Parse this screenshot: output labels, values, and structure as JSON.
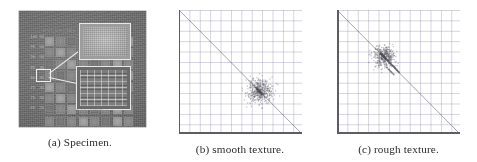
{
  "figure": {
    "layout": "three-panel-row",
    "panels": [
      {
        "id": "a",
        "caption": "(a) Specimen.",
        "type": "photograph",
        "subject": "grayscale photograph of a metal specimen plate bearing an 8x8 matrix of machined pads, with two white rectangular callout insets magnifying a smooth-textured pad and a rough-textured pad",
        "plate_color": "#6d6d6d",
        "inset_border_color": "#e8e8e8",
        "pad_rows": 8,
        "pad_cols": 8,
        "engraved_labels": {
          "header": "W/WC SPECIMEN",
          "row_values": [
            "105",
            "95",
            "90",
            "85",
            "80",
            "75",
            "70",
            "65"
          ],
          "row_values_secondary": [
            "60",
            "55",
            "50",
            "45",
            "40",
            "35",
            "30",
            "25"
          ],
          "footer_line_1": "Feature x Range (0-4.0 / 0-88.00 s)",
          "footer_line_2": "4  8  12  16  20  24  28  32  (kHz)"
        }
      },
      {
        "id": "b",
        "caption": "(b) smooth texture.",
        "type": "scatter"
      },
      {
        "id": "c",
        "caption": "(c) rough texture.",
        "type": "scatter"
      }
    ]
  },
  "chart_data": [
    {
      "id": "b",
      "type": "scatter",
      "title": "(b) smooth texture.",
      "xlabel": "",
      "ylabel": "",
      "xlim": [
        0,
        1
      ],
      "ylim": [
        0,
        1
      ],
      "grid": true,
      "grid_spacing": 0.0847,
      "legend": "none",
      "annotations": [
        {
          "kind": "line",
          "name": "anti-diagonal-constraint-line",
          "x": [
            0,
            1
          ],
          "y": [
            1,
            0
          ],
          "color": "#5a5a64"
        }
      ],
      "cluster": {
        "center_x": 0.655,
        "center_y": 0.344,
        "spread_x": 0.052,
        "spread_y": 0.046,
        "n_points": 420,
        "description": "single tight compact blob straddling the anti-diagonal"
      },
      "points_x": [
        0.655,
        0.642,
        0.668,
        0.651,
        0.661,
        0.636,
        0.672,
        0.647,
        0.659,
        0.664,
        0.631,
        0.678,
        0.649,
        0.657,
        0.666,
        0.644,
        0.653,
        0.67,
        0.639,
        0.662,
        0.656,
        0.648,
        0.674,
        0.633,
        0.66,
        0.652,
        0.667,
        0.641,
        0.658,
        0.663,
        0.646,
        0.671,
        0.637,
        0.654,
        0.665,
        0.65,
        0.676,
        0.643,
        0.659,
        0.655,
        0.669,
        0.634,
        0.661,
        0.647,
        0.673,
        0.64,
        0.656,
        0.664,
        0.645,
        0.657,
        0.68,
        0.628,
        0.662,
        0.651,
        0.668,
        0.638,
        0.653,
        0.675,
        0.644,
        0.66,
        0.649,
        0.666,
        0.635,
        0.658,
        0.67,
        0.642,
        0.654,
        0.663,
        0.647,
        0.659,
        0.684,
        0.624,
        0.665,
        0.65,
        0.671,
        0.64,
        0.656,
        0.677,
        0.646,
        0.661
      ],
      "points_y": [
        0.344,
        0.357,
        0.331,
        0.349,
        0.338,
        0.364,
        0.327,
        0.353,
        0.341,
        0.335,
        0.369,
        0.321,
        0.351,
        0.343,
        0.333,
        0.356,
        0.346,
        0.329,
        0.361,
        0.337,
        0.343,
        0.352,
        0.325,
        0.366,
        0.339,
        0.348,
        0.332,
        0.359,
        0.341,
        0.336,
        0.354,
        0.328,
        0.363,
        0.345,
        0.334,
        0.35,
        0.323,
        0.357,
        0.34,
        0.344,
        0.33,
        0.365,
        0.338,
        0.353,
        0.326,
        0.36,
        0.342,
        0.335,
        0.355,
        0.341,
        0.319,
        0.372,
        0.337,
        0.348,
        0.331,
        0.362,
        0.346,
        0.324,
        0.356,
        0.339,
        0.35,
        0.333,
        0.365,
        0.341,
        0.329,
        0.358,
        0.345,
        0.336,
        0.352,
        0.34,
        0.315,
        0.376,
        0.334,
        0.349,
        0.328,
        0.359,
        0.343,
        0.322,
        0.353,
        0.338
      ]
    },
    {
      "id": "c",
      "type": "scatter",
      "title": "(c) rough texture.",
      "xlabel": "",
      "ylabel": "",
      "xlim": [
        0,
        1
      ],
      "ylim": [
        0,
        1
      ],
      "grid": true,
      "grid_spacing": 0.0847,
      "legend": "none",
      "annotations": [
        {
          "kind": "line",
          "name": "anti-diagonal-constraint-line",
          "x": [
            0,
            1
          ],
          "y": [
            1,
            0
          ],
          "color": "#5a5a64"
        }
      ],
      "cluster": {
        "center_x": 0.378,
        "center_y": 0.627,
        "spread_x": 0.044,
        "spread_y": 0.042,
        "n_points": 380,
        "description": "dense dark core high on the anti-diagonal plus a diffuse scattered tail of outliers trailing down and to the right"
      },
      "points_x": [
        0.378,
        0.366,
        0.389,
        0.372,
        0.383,
        0.36,
        0.394,
        0.369,
        0.381,
        0.386,
        0.356,
        0.399,
        0.374,
        0.379,
        0.391,
        0.364,
        0.376,
        0.393,
        0.362,
        0.385,
        0.377,
        0.37,
        0.396,
        0.358,
        0.384,
        0.373,
        0.39,
        0.365,
        0.38,
        0.387,
        0.368,
        0.395,
        0.359,
        0.375,
        0.388,
        0.371,
        0.398,
        0.363,
        0.382,
        0.378,
        0.392,
        0.357,
        0.386,
        0.369,
        0.397,
        0.361,
        0.379,
        0.388,
        0.367,
        0.381,
        0.402,
        0.352,
        0.387,
        0.373,
        0.393,
        0.36,
        0.376,
        0.4,
        0.366,
        0.384,
        0.438,
        0.466,
        0.421,
        0.489,
        0.452,
        0.409,
        0.503,
        0.444,
        0.472,
        0.418,
        0.497,
        0.431,
        0.459,
        0.486,
        0.413,
        0.477,
        0.425,
        0.462,
        0.441,
        0.505,
        0.448,
        0.416,
        0.481,
        0.434,
        0.468,
        0.492,
        0.427,
        0.455,
        0.474,
        0.411,
        0.404,
        0.429,
        0.447,
        0.418,
        0.462,
        0.436,
        0.408,
        0.455,
        0.424,
        0.441
      ],
      "points_y": [
        0.627,
        0.64,
        0.615,
        0.633,
        0.621,
        0.646,
        0.609,
        0.637,
        0.624,
        0.618,
        0.65,
        0.604,
        0.631,
        0.626,
        0.612,
        0.642,
        0.629,
        0.61,
        0.644,
        0.619,
        0.628,
        0.635,
        0.607,
        0.648,
        0.62,
        0.632,
        0.613,
        0.641,
        0.625,
        0.617,
        0.638,
        0.608,
        0.647,
        0.63,
        0.616,
        0.634,
        0.605,
        0.643,
        0.623,
        0.627,
        0.611,
        0.649,
        0.618,
        0.637,
        0.606,
        0.645,
        0.626,
        0.615,
        0.639,
        0.624,
        0.6,
        0.654,
        0.617,
        0.632,
        0.611,
        0.646,
        0.629,
        0.602,
        0.64,
        0.621,
        0.566,
        0.539,
        0.585,
        0.513,
        0.551,
        0.597,
        0.498,
        0.559,
        0.532,
        0.588,
        0.505,
        0.573,
        0.546,
        0.518,
        0.592,
        0.527,
        0.58,
        0.542,
        0.563,
        0.496,
        0.555,
        0.589,
        0.521,
        0.57,
        0.536,
        0.509,
        0.577,
        0.549,
        0.529,
        0.594,
        0.538,
        0.512,
        0.494,
        0.523,
        0.48,
        0.505,
        0.534,
        0.487,
        0.518,
        0.501
      ]
    }
  ]
}
